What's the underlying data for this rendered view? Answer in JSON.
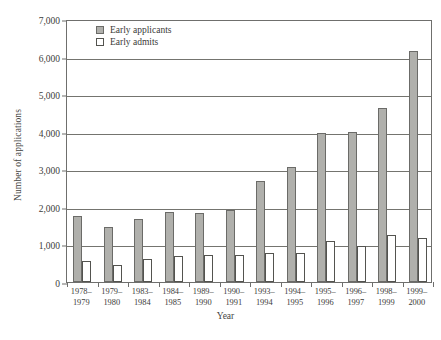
{
  "chart_data": {
    "type": "bar",
    "title": "",
    "xlabel": "Year",
    "ylabel": "Number of applications",
    "ylim": [
      0,
      7000
    ],
    "ytick_step": 1000,
    "yticks": [
      0,
      1000,
      2000,
      3000,
      4000,
      5000,
      6000,
      7000
    ],
    "ytick_labels": [
      "0",
      "1,000",
      "2,000",
      "3,000",
      "4,000",
      "5,000",
      "6,000",
      "7,000"
    ],
    "grid": true,
    "legend_position": "top-left-inside",
    "categories": [
      "1978–1979",
      "1979–1980",
      "1983–1984",
      "1984–1985",
      "1989–1990",
      "1990–1991",
      "1993–1994",
      "1994–1995",
      "1995–1996",
      "1996–1997",
      "1998–1999",
      "1999–2000"
    ],
    "category_lines": [
      [
        "1978–",
        "1979"
      ],
      [
        "1979–",
        "1980"
      ],
      [
        "1983–",
        "1984"
      ],
      [
        "1984–",
        "1985"
      ],
      [
        "1989–",
        "1990"
      ],
      [
        "1990–",
        "1991"
      ],
      [
        "1993–",
        "1994"
      ],
      [
        "1994–",
        "1995"
      ],
      [
        "1995–",
        "1996"
      ],
      [
        "1996–",
        "1997"
      ],
      [
        "1998–",
        "1999"
      ],
      [
        "1999–",
        "2000"
      ]
    ],
    "series": [
      {
        "name": "Early applicants",
        "color": "#b0b0ac",
        "values": [
          1760,
          1470,
          1670,
          1860,
          1840,
          1930,
          2700,
          3050,
          3970,
          3990,
          4620,
          6150
        ]
      },
      {
        "name": "Early admits",
        "color": "#ffffff",
        "values": [
          570,
          440,
          600,
          690,
          730,
          720,
          770,
          760,
          1090,
          950,
          1240,
          1180
        ]
      }
    ]
  },
  "legend": {
    "items": [
      {
        "label": "Early applicants",
        "swatch": "applicants"
      },
      {
        "label": "Early admits",
        "swatch": "admits"
      }
    ]
  },
  "axes": {
    "x_title": "Year",
    "y_title": "Number of applications"
  }
}
